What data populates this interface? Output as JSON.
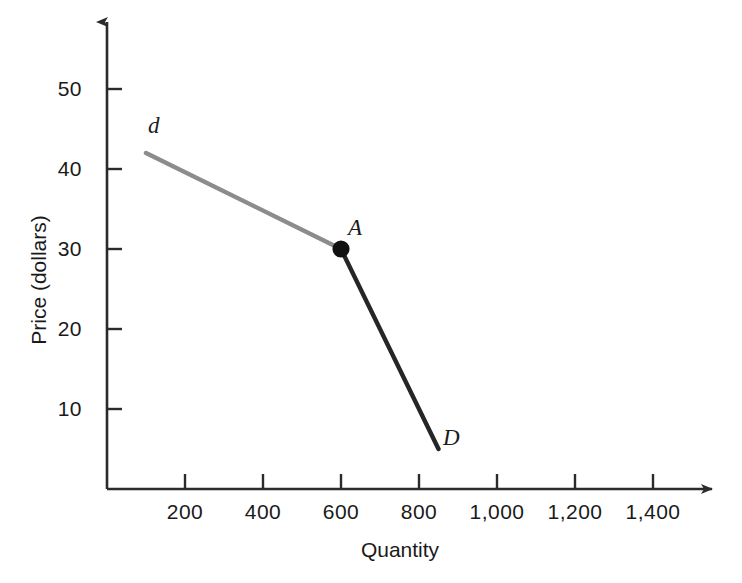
{
  "chart_data": {
    "type": "line",
    "title": "",
    "xlabel": "Quantity",
    "ylabel": "Price (dollars)",
    "xlim": [
      0,
      1500
    ],
    "ylim": [
      0,
      57
    ],
    "grid": false,
    "legend": "none",
    "xticks": [
      {
        "value": 200,
        "label": "200"
      },
      {
        "value": 400,
        "label": "400"
      },
      {
        "value": 600,
        "label": "600"
      },
      {
        "value": 800,
        "label": "800"
      },
      {
        "value": 1000,
        "label": "1,000"
      },
      {
        "value": 1200,
        "label": "1,200"
      },
      {
        "value": 1400,
        "label": "1,400"
      }
    ],
    "yticks": [
      {
        "value": 10,
        "label": "10"
      },
      {
        "value": 20,
        "label": "20"
      },
      {
        "value": 30,
        "label": "30"
      },
      {
        "value": 40,
        "label": "40"
      },
      {
        "value": 50,
        "label": "50"
      }
    ],
    "series": [
      {
        "name": "d",
        "label": "d",
        "color": "#8c8c8c",
        "linewidth": 4,
        "points": [
          {
            "x": 100,
            "y": 42
          },
          {
            "x": 600,
            "y": 30
          }
        ]
      },
      {
        "name": "D",
        "label": "D",
        "color": "#262626",
        "linewidth": 4,
        "points": [
          {
            "x": 600,
            "y": 30
          },
          {
            "x": 850,
            "y": 5
          }
        ]
      }
    ],
    "annotations": [
      {
        "name": "point-A",
        "label": "A",
        "x": 600,
        "y": 30,
        "marker": "filled-circle",
        "marker_color": "#111111",
        "marker_size": 11
      },
      {
        "name": "curve-label-d",
        "label": "d",
        "x": 100,
        "y": 46
      },
      {
        "name": "curve-label-D",
        "label": "D",
        "x": 880,
        "y": 4
      }
    ],
    "axis_style": {
      "color": "#2b2b2b",
      "arrowheads": true,
      "tick_direction": "outward"
    }
  }
}
